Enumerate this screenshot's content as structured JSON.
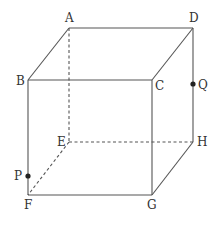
{
  "diagram": {
    "type": "cube",
    "title": "",
    "vertices": [
      "A",
      "B",
      "C",
      "D",
      "E",
      "F",
      "G",
      "H"
    ],
    "visible_edges": [
      [
        "A",
        "D"
      ],
      [
        "A",
        "B"
      ],
      [
        "B",
        "C"
      ],
      [
        "C",
        "D"
      ],
      [
        "B",
        "F"
      ],
      [
        "C",
        "G"
      ],
      [
        "D",
        "H"
      ],
      [
        "F",
        "G"
      ],
      [
        "G",
        "H"
      ]
    ],
    "hidden_edges": [
      [
        "A",
        "E"
      ],
      [
        "E",
        "F"
      ],
      [
        "E",
        "H"
      ]
    ],
    "points": [
      {
        "name": "P",
        "on_edge": [
          "B",
          "F"
        ],
        "description": "point on edge BF near F"
      },
      {
        "name": "Q",
        "on_edge": [
          "D",
          "H"
        ],
        "description": "point on edge DH near D"
      }
    ],
    "labels": {
      "A": "A",
      "B": "B",
      "C": "C",
      "D": "D",
      "E": "E",
      "F": "F",
      "G": "G",
      "H": "H",
      "P": "P",
      "Q": "Q"
    },
    "colors": {
      "edge": "#555555",
      "label": "#333333",
      "point": "#222222"
    }
  }
}
